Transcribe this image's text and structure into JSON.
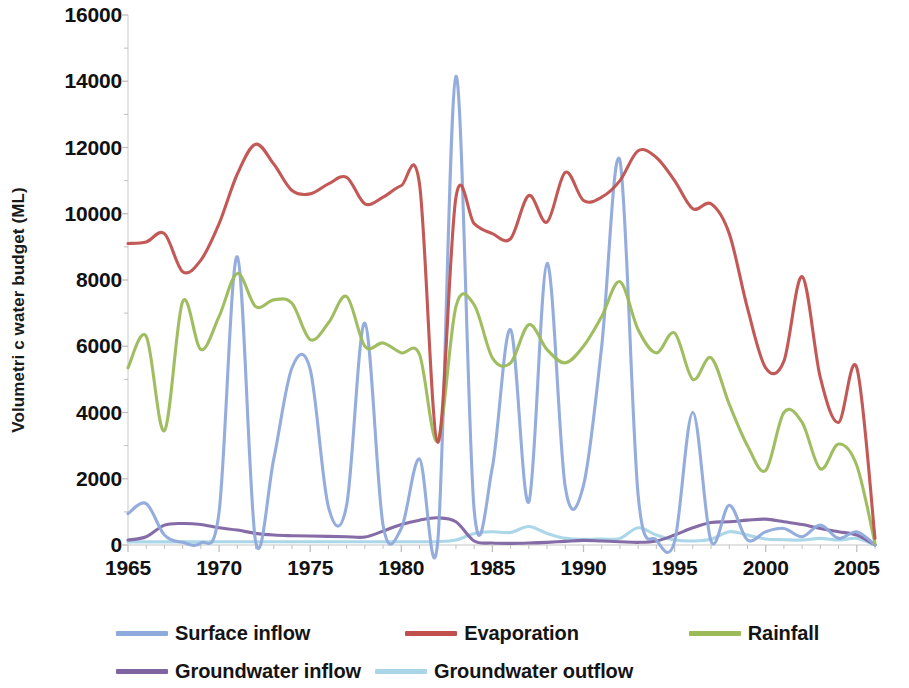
{
  "chart_data": {
    "type": "line",
    "title": "",
    "xlabel": "",
    "ylabel": "Volumetri c water budget (ML)",
    "xlim": [
      1965,
      2006
    ],
    "ylim": [
      0,
      16000
    ],
    "grid": false,
    "legend_position": "bottom",
    "y_ticks": [
      0,
      2000,
      4000,
      6000,
      8000,
      10000,
      12000,
      14000,
      16000
    ],
    "y_tick_labels": [
      "0",
      "2000",
      "4000",
      "6000",
      "8000",
      "10000",
      "12000",
      "14000",
      "16000"
    ],
    "x_ticks": [
      1965,
      1970,
      1975,
      1980,
      1985,
      1990,
      1995,
      2000,
      2005
    ],
    "x_tick_labels": [
      "1965",
      "1970",
      "1975",
      "1980",
      "1985",
      "1990",
      "1995",
      "2000",
      "2005"
    ],
    "y_minor_tick_interval": 1000,
    "x_minor_tick_interval": 1,
    "x": [
      1965,
      1966,
      1967,
      1968,
      1969,
      1970,
      1971,
      1972,
      1973,
      1974,
      1975,
      1976,
      1977,
      1978,
      1979,
      1980,
      1981,
      1982,
      1983,
      1984,
      1985,
      1986,
      1987,
      1988,
      1989,
      1990,
      1991,
      1992,
      1993,
      1994,
      1995,
      1996,
      1997,
      1998,
      1999,
      2000,
      2001,
      2002,
      2003,
      2004,
      2005,
      2006
    ],
    "series": [
      {
        "name": "Surface inflow",
        "color": "#8EA9DB",
        "values": [
          950,
          1250,
          300,
          80,
          60,
          1000,
          8700,
          120,
          2600,
          5350,
          5300,
          1150,
          1200,
          6700,
          600,
          500,
          2600,
          100,
          14150,
          1050,
          2350,
          6500,
          1300,
          8500,
          1750,
          1800,
          6000,
          11600,
          1500,
          150,
          100,
          4000,
          120,
          1200,
          150,
          400,
          500,
          250,
          600,
          200,
          400,
          0
        ]
      },
      {
        "name": "Evaporation",
        "color": "#C0504D",
        "values": [
          9100,
          9150,
          9400,
          8250,
          8600,
          9700,
          11200,
          12100,
          11500,
          10700,
          10600,
          10900,
          11100,
          10300,
          10500,
          10850,
          10900,
          3100,
          10500,
          9700,
          9400,
          9250,
          10550,
          9750,
          11250,
          10400,
          10500,
          11000,
          11900,
          11700,
          11000,
          10150,
          10300,
          9400,
          7150,
          5350,
          5550,
          8100,
          5050,
          3700,
          5350,
          200
        ]
      },
      {
        "name": "Rainfall",
        "color": "#9BBB59",
        "values": [
          5350,
          6300,
          3450,
          7350,
          5900,
          6900,
          8200,
          7200,
          7400,
          7300,
          6200,
          6700,
          7500,
          6000,
          6100,
          5800,
          5750,
          3150,
          7200,
          7250,
          5650,
          5500,
          6650,
          5900,
          5500,
          6000,
          6900,
          7950,
          6500,
          5800,
          6400,
          5000,
          5650,
          4250,
          3000,
          2250,
          4000,
          3700,
          2300,
          3050,
          2400,
          50
        ]
      },
      {
        "name": "Groundwater inflow",
        "color": "#8064A2",
        "values": [
          150,
          250,
          600,
          650,
          620,
          520,
          450,
          350,
          300,
          280,
          270,
          260,
          250,
          240,
          420,
          620,
          750,
          820,
          700,
          120,
          60,
          50,
          60,
          80,
          110,
          140,
          120,
          100,
          80,
          120,
          300,
          520,
          680,
          700,
          750,
          780,
          700,
          620,
          500,
          400,
          300,
          0
        ]
      },
      {
        "name": "Groundwater outflow",
        "color": "#A8D5E8",
        "values": [
          90,
          95,
          95,
          95,
          95,
          100,
          100,
          100,
          100,
          100,
          100,
          100,
          100,
          100,
          100,
          100,
          100,
          100,
          150,
          350,
          400,
          380,
          560,
          350,
          200,
          170,
          180,
          200,
          520,
          300,
          150,
          120,
          170,
          400,
          300,
          180,
          160,
          150,
          200,
          150,
          200,
          0
        ]
      }
    ]
  },
  "legend": {
    "row1": [
      {
        "label": "Surface inflow",
        "color": "#8EA9DB"
      },
      {
        "label": "Evaporation",
        "color": "#C0504D"
      },
      {
        "label": "Rainfall",
        "color": "#9BBB59"
      }
    ],
    "row2": [
      {
        "label": "Groundwater inflow",
        "color": "#8064A2"
      },
      {
        "label": "Groundwater outflow",
        "color": "#A8D5E8"
      }
    ]
  },
  "axis": {
    "line_color": "#D9D9D9",
    "tick_color": "#BFBFBF"
  }
}
